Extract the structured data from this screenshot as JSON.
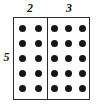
{
  "diagram": {
    "type": "array-model",
    "rows": 5,
    "row_label": "5",
    "sections": [
      {
        "name": "left-group",
        "label": "2",
        "columns": 2
      },
      {
        "name": "right-group",
        "label": "3",
        "columns": 3
      }
    ],
    "total_columns": 5,
    "total_dots": 25,
    "colors": {
      "dot": "#161616",
      "border": "#2b2b2b",
      "background": "#ffffff",
      "label_text": "#1a1a1a"
    }
  },
  "chart_data": {
    "type": "table",
    "xlabel": "",
    "ylabel": "",
    "categories": [
      "2",
      "3"
    ],
    "values": [
      2,
      3
    ],
    "series": [
      {
        "name": "left-group",
        "columns": 2,
        "rows": 5,
        "dots": 10
      },
      {
        "name": "right-group",
        "columns": 3,
        "rows": 5,
        "dots": 15
      }
    ],
    "annotations": [
      "2",
      "3",
      "5"
    ]
  }
}
